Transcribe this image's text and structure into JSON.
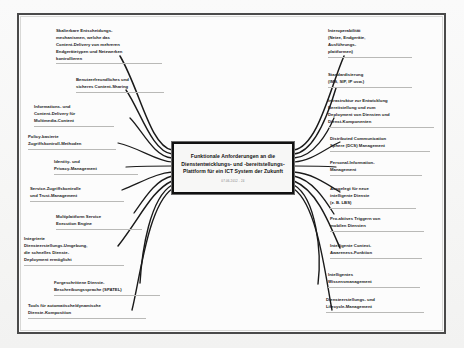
{
  "diagram": {
    "type": "mind-map",
    "language": "de",
    "central": {
      "title": "Funktionale Anforderungen an die Dienstentwicklungs- und -bereitstellungs-Plattform für ein ICT System der Zukunft",
      "subtitle": "07.06.2012 - 24"
    },
    "left_branches": [
      {
        "id": "skalierbare-entscheidungsmechanismen",
        "label": "Skalierbare Entscheidungs-\nmechanismen, welche das\nContent-Delivery von mehreren\nEndgerätetypen und Netzwerken\nkontrollieren"
      },
      {
        "id": "content-sharing",
        "label": "Benutzerfreundliches und\nsicheres Content-Sharing"
      },
      {
        "id": "multimedia-content-delivery",
        "label": "Informations- und\nContent-Delivery für\nMultimedia-Content"
      },
      {
        "id": "policy-zugriffskontrolle",
        "label": "Policy-basierte\nZugriffskontroll-Methoden"
      },
      {
        "id": "identity-privacy-management",
        "label": "Identity- und\nPrivacy-Management"
      },
      {
        "id": "service-zugriffskontrolle",
        "label": "Service-Zugriffskontrolle\nund Trust-Management"
      },
      {
        "id": "multiplattform-execution-engine",
        "label": "Multiplattform Service\nExecution Engine"
      },
      {
        "id": "integrierte-diensteerstellungs-umgebung",
        "label": "Integrierte\nDiensteerstellungs-Umgebung,\ndie schnelles Dienste-\nDeployment ermöglicht"
      },
      {
        "id": "dienste-beschreibungssprache",
        "label": "Forgeschrittene Dienste-\nBeschreibungssprache (SPATEL)"
      },
      {
        "id": "dienste-komposition-tools",
        "label": "Tools für automatische/dynamische\nDienste-Komposition"
      }
    ],
    "right_branches": [
      {
        "id": "interoperabilitaet",
        "label": "Interoperabilität\n(Netze, Endgeräte,\nAusführungs-\nplattformen)"
      },
      {
        "id": "standardisierung",
        "label": "Standardisierung\n(IMS, SIP, IP usw.)"
      },
      {
        "id": "infrastruktur-entwicklung-deployment",
        "label": "Infrastruktur zur Entwicklung\nBereitstellung und zum\nDeployment von Diensten und\nDienst-Komponenten"
      },
      {
        "id": "dcs-management",
        "label": "Distributed Communication\nSphere (DCS) Management"
      },
      {
        "id": "personal-information-management",
        "label": "Personal-Information-\nManagement"
      },
      {
        "id": "intelligente-dienste-lbs",
        "label": "Ausgelegt für neue\nintelligente Dienste\n(z. B. LBS)"
      },
      {
        "id": "pro-aktives-triggern",
        "label": "Pro-aktives Triggern von\nmobilen Diensten"
      },
      {
        "id": "context-awareness",
        "label": "Intelligente Context-\nAwareness-Funktion"
      },
      {
        "id": "wissensmanagement",
        "label": "Intelligentes\nWissensmanagement"
      },
      {
        "id": "lifecycle-management",
        "label": "Diensteerstellungs- und\nLifecycle-Management"
      }
    ],
    "colors": {
      "frame": "#4a4a4a",
      "central_border": "#111111",
      "central_fill": "#f7f7f6",
      "connector": "#1a1a1a",
      "text": "#1b1b1b",
      "underline": "#b9b9b7",
      "paper": "#fcfcfc"
    }
  }
}
